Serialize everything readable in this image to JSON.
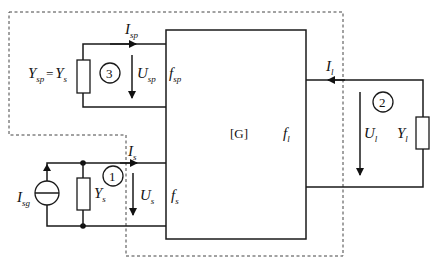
{
  "diagram": {
    "block_label": "[G]",
    "ports": {
      "source": {
        "number": "1",
        "current": {
          "main": "I",
          "sub": "s"
        },
        "voltage": {
          "main": "U",
          "sub": "s"
        },
        "port_label": {
          "main": "f",
          "sub": "s"
        },
        "source_current": {
          "main": "I",
          "sub": "sg"
        },
        "admittance": {
          "main": "Y",
          "sub": "s"
        }
      },
      "load": {
        "number": "2",
        "current": {
          "main": "I",
          "sub": "l"
        },
        "voltage": {
          "main": "U",
          "sub": "l"
        },
        "port_label": {
          "main": "f",
          "sub": "l"
        },
        "admittance": {
          "main": "Y",
          "sub": "l"
        }
      },
      "spare": {
        "number": "3",
        "current": {
          "main": "I",
          "sub": "sp"
        },
        "voltage": {
          "main": "U",
          "sub": "sp"
        },
        "port_label": {
          "main": "f",
          "sub": "sp"
        },
        "admittance_eq": {
          "lhs_main": "Y",
          "lhs_sub": "sp",
          "eq": "=",
          "rhs_main": "Y",
          "rhs_sub": "s"
        }
      }
    }
  }
}
